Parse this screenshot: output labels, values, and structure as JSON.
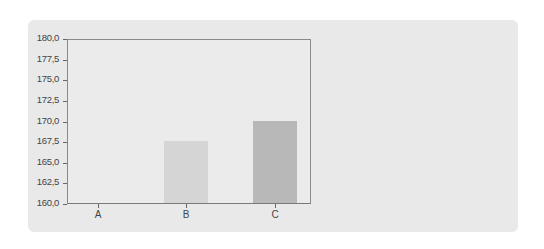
{
  "chart_data": {
    "type": "bar",
    "title": "",
    "xlabel": "",
    "ylabel": "",
    "categories": [
      "A",
      "B",
      "C"
    ],
    "values": [
      160.0,
      167.5,
      170.0
    ],
    "bar_colors": [
      "#e3e3e3",
      "#d5d5d5",
      "#b8b8b8"
    ],
    "ylim": [
      160.0,
      180.0
    ],
    "yticks": [
      "160,0",
      "162,5",
      "165,0",
      "167,5",
      "170,0",
      "172,5",
      "175,0",
      "177,5",
      "180,0"
    ],
    "grid": false,
    "legend": null
  },
  "colors": {
    "card_background": "#e9e9e9",
    "axis": "#7a7a7a"
  }
}
